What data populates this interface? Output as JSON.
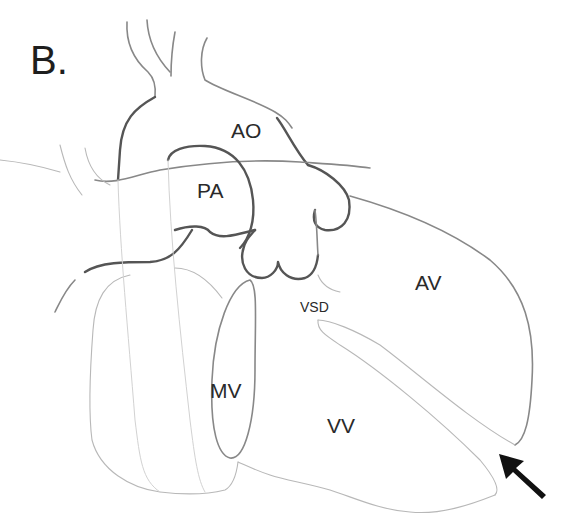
{
  "figure": {
    "panel_label": "B.",
    "type": "anatomical line drawing of heart",
    "labels": {
      "aorta": "AO",
      "pulmonary_artery": "PA",
      "ventricular_septal_defect": "VSD",
      "arterial_ventricle": "AV",
      "mitral_valve": "MV",
      "venous_ventricle": "VV"
    },
    "arrow": {
      "direction": "pointing up-left",
      "color": "#111111",
      "target": "apical septum gap between AV and VV"
    },
    "colors": {
      "background": "#ffffff",
      "outline_dark": "#555555",
      "outline_light": "#b8b8b8",
      "text": "#2a2a2a"
    }
  }
}
